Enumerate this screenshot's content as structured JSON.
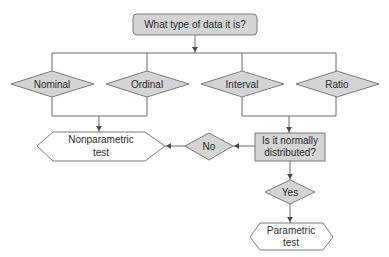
{
  "diagram": {
    "type": "flowchart",
    "colors": {
      "node_fill": "#d4d4d4",
      "terminal_fill": "#ffffff",
      "stroke": "#7a7a7a",
      "text": "#2a2a2a"
    },
    "nodes": {
      "question": {
        "label": "What type of data it is?",
        "shape": "rounded-rectangle"
      },
      "nominal": {
        "label": "Nominal",
        "shape": "diamond"
      },
      "ordinal": {
        "label": "Ordinal",
        "shape": "diamond"
      },
      "interval": {
        "label": "Interval",
        "shape": "diamond"
      },
      "ratio": {
        "label": "Ratio",
        "shape": "diamond"
      },
      "normal": {
        "line1": "Is it normally",
        "line2": "distributed?",
        "shape": "rectangle"
      },
      "no": {
        "label": "No",
        "shape": "diamond"
      },
      "yes": {
        "label": "Yes",
        "shape": "diamond"
      },
      "nonparametric": {
        "line1": "Nonparametric",
        "line2": "test",
        "shape": "hexagon"
      },
      "parametric": {
        "line1": "Parametric",
        "line2": "test",
        "shape": "hexagon"
      }
    },
    "edges": [
      {
        "from": "question",
        "to": [
          "nominal",
          "ordinal",
          "interval",
          "ratio"
        ]
      },
      {
        "from": [
          "nominal",
          "ordinal"
        ],
        "to": "nonparametric"
      },
      {
        "from": [
          "interval",
          "ratio"
        ],
        "to": "normal"
      },
      {
        "from": "normal",
        "to": "no"
      },
      {
        "from": "no",
        "to": "nonparametric"
      },
      {
        "from": "normal",
        "to": "yes"
      },
      {
        "from": "yes",
        "to": "parametric"
      }
    ]
  }
}
